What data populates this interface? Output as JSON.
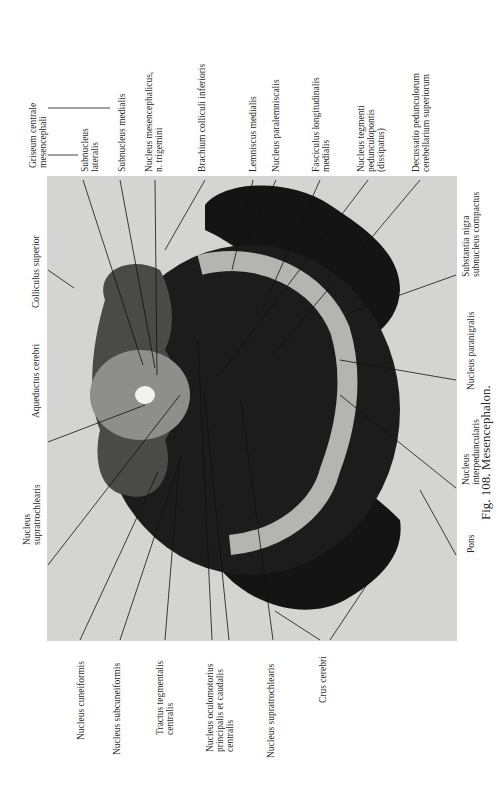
{
  "figure": {
    "caption": "Fig. 108. Mesencephalon.",
    "orientation": "rotated -90deg (landscape figure on portrait page)"
  },
  "labels_top": [
    {
      "lines": [
        "Griseum centrale",
        "mesencephali"
      ]
    },
    {
      "lines": [
        "Subnucleus",
        "lateralis"
      ]
    },
    {
      "lines": [
        "Subnucleus  medialis"
      ]
    },
    {
      "lines": [
        "Nucleus mesencephalicus,",
        "n. trigemini"
      ]
    },
    {
      "lines": [
        "Brachium colliculi inferioris"
      ]
    },
    {
      "lines": [
        "Lemniscus medialis"
      ]
    },
    {
      "lines": [
        "Nucleus paralemniscalis"
      ]
    },
    {
      "lines": [
        "Fasciculus longitudinalis",
        "medialis"
      ]
    },
    {
      "lines": [
        "Nucleus tegmenti",
        "pedunculopontis",
        "(dissipatus)"
      ]
    },
    {
      "lines": [
        "Decussatio pedunculorum",
        "cerebellarium superiorum"
      ]
    }
  ],
  "labels_left": [
    {
      "lines": [
        "Colliculus superior"
      ]
    },
    {
      "lines": [
        "Aqueductus cerebri"
      ]
    },
    {
      "lines": [
        "Nucleus",
        "supratrochlearis"
      ]
    }
  ],
  "labels_right": [
    {
      "lines": [
        "Substantia nigra",
        "subnucleus compactus"
      ]
    },
    {
      "lines": [
        "Nucleus paranigralis"
      ]
    },
    {
      "lines": [
        "Nucleus",
        "interpeduncularis"
      ]
    },
    {
      "lines": [
        "Pons"
      ]
    }
  ],
  "labels_bottom": [
    {
      "lines": [
        "Nucleus cuneiformis"
      ]
    },
    {
      "lines": [
        "Nucleus subcuneiformis"
      ]
    },
    {
      "lines": [
        "Tractus tegmentalis",
        "centralis"
      ]
    },
    {
      "lines": [
        "Nucleus oculomotorius",
        "principalis et caudalis",
        "centralis"
      ]
    },
    {
      "lines": [
        "Nucleus supratrochlearis"
      ]
    },
    {
      "lines": [
        "Crus cerebri"
      ]
    }
  ]
}
